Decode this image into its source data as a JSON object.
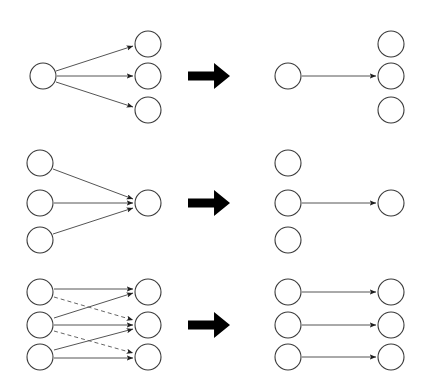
{
  "figure": {
    "background_color": "#ffffff",
    "node_fill": "#ffffff",
    "node_stroke": "#3a3a3a",
    "edge_color": "#555555",
    "transform_arrow_color": "#000000",
    "label_color": "#1a1a1a",
    "node_radius": 13
  },
  "panels": [
    {
      "id": "A",
      "label": "A",
      "label_x": 14,
      "label_y": 33,
      "description": "one source node fanning out to three target nodes",
      "left_nodes": [
        {
          "name": "a-source-1",
          "cx": 43,
          "cy": 76
        }
      ],
      "right_nodes": [
        {
          "name": "a-target-1",
          "cx": 148,
          "cy": 44
        },
        {
          "name": "a-target-2",
          "cx": 148,
          "cy": 76
        },
        {
          "name": "a-target-3",
          "cx": 148,
          "cy": 110
        }
      ],
      "edges": [
        {
          "from": [
            56,
            71
          ],
          "to": [
            133,
            46
          ],
          "style": "solid"
        },
        {
          "from": [
            57,
            76
          ],
          "to": [
            133,
            76
          ],
          "style": "solid"
        },
        {
          "from": [
            56,
            82
          ],
          "to": [
            133,
            107
          ],
          "style": "solid"
        }
      ]
    },
    {
      "id": "A-prime",
      "label": "A′",
      "label_x": 253,
      "label_y": 33,
      "description": "one source node with a single arrow to the middle target node",
      "left_nodes": [
        {
          "name": "aprime-source-1",
          "cx": 288,
          "cy": 76
        }
      ],
      "right_nodes": [
        {
          "name": "aprime-target-1",
          "cx": 391,
          "cy": 44
        },
        {
          "name": "aprime-target-2",
          "cx": 391,
          "cy": 76
        },
        {
          "name": "aprime-target-3",
          "cx": 391,
          "cy": 110
        }
      ],
      "edges": [
        {
          "from": [
            302,
            76
          ],
          "to": [
            376,
            76
          ],
          "style": "solid"
        }
      ]
    },
    {
      "id": "B",
      "label": "B",
      "label_x": 14,
      "label_y": 161,
      "description": "three source nodes converging onto one target node",
      "left_nodes": [
        {
          "name": "b-source-1",
          "cx": 40,
          "cy": 163
        },
        {
          "name": "b-source-2",
          "cx": 40,
          "cy": 203
        },
        {
          "name": "b-source-3",
          "cx": 40,
          "cy": 240
        }
      ],
      "right_nodes": [
        {
          "name": "b-target-1",
          "cx": 148,
          "cy": 203
        }
      ],
      "edges": [
        {
          "from": [
            53,
            169
          ],
          "to": [
            133,
            199
          ],
          "style": "solid"
        },
        {
          "from": [
            54,
            203
          ],
          "to": [
            133,
            203
          ],
          "style": "solid"
        },
        {
          "from": [
            53,
            234
          ],
          "to": [
            133,
            208
          ],
          "style": "solid"
        }
      ]
    },
    {
      "id": "B-prime",
      "label": "B′",
      "label_x": 253,
      "label_y": 161,
      "description": "three source nodes with a single arrow from the middle one",
      "left_nodes": [
        {
          "name": "bprime-source-1",
          "cx": 288,
          "cy": 163
        },
        {
          "name": "bprime-source-2",
          "cx": 288,
          "cy": 203
        },
        {
          "name": "bprime-source-3",
          "cx": 288,
          "cy": 240
        }
      ],
      "right_nodes": [
        {
          "name": "bprime-target-1",
          "cx": 391,
          "cy": 203
        }
      ],
      "edges": [
        {
          "from": [
            302,
            203
          ],
          "to": [
            376,
            203
          ],
          "style": "solid"
        }
      ]
    },
    {
      "id": "C",
      "label": "C",
      "label_x": 14,
      "label_y": 283,
      "description": "three source nodes mapping to three target nodes with crossing solid and dashed edges",
      "left_nodes": [
        {
          "name": "c-source-1",
          "cx": 40,
          "cy": 292
        },
        {
          "name": "c-source-2",
          "cx": 40,
          "cy": 325
        },
        {
          "name": "c-source-3",
          "cx": 40,
          "cy": 357
        }
      ],
      "right_nodes": [
        {
          "name": "c-target-1",
          "cx": 148,
          "cy": 292
        },
        {
          "name": "c-target-2",
          "cx": 148,
          "cy": 325
        },
        {
          "name": "c-target-3",
          "cx": 148,
          "cy": 357
        }
      ],
      "edges": [
        {
          "from": [
            54,
            289
          ],
          "to": [
            133,
            289
          ],
          "style": "solid"
        },
        {
          "from": [
            54,
            297
          ],
          "to": [
            133,
            320
          ],
          "style": "dashed"
        },
        {
          "from": [
            54,
            318
          ],
          "to": [
            133,
            293
          ],
          "style": "solid"
        },
        {
          "from": [
            54,
            325
          ],
          "to": [
            133,
            325
          ],
          "style": "solid"
        },
        {
          "from": [
            54,
            331
          ],
          "to": [
            133,
            353
          ],
          "style": "dashed"
        },
        {
          "from": [
            54,
            350
          ],
          "to": [
            133,
            329
          ],
          "style": "solid"
        },
        {
          "from": [
            54,
            358
          ],
          "to": [
            133,
            358
          ],
          "style": "solid"
        }
      ]
    },
    {
      "id": "C-prime",
      "label": "C′",
      "label_x": 253,
      "label_y": 283,
      "description": "three source nodes each with one horizontal arrow to the matching target node",
      "left_nodes": [
        {
          "name": "cprime-source-1",
          "cx": 288,
          "cy": 292
        },
        {
          "name": "cprime-source-2",
          "cx": 288,
          "cy": 325
        },
        {
          "name": "cprime-source-3",
          "cx": 288,
          "cy": 357
        }
      ],
      "right_nodes": [
        {
          "name": "cprime-target-1",
          "cx": 391,
          "cy": 292
        },
        {
          "name": "cprime-target-2",
          "cx": 391,
          "cy": 325
        },
        {
          "name": "cprime-target-3",
          "cx": 391,
          "cy": 357
        }
      ],
      "edges": [
        {
          "from": [
            302,
            292
          ],
          "to": [
            376,
            292
          ],
          "style": "solid"
        },
        {
          "from": [
            302,
            325
          ],
          "to": [
            376,
            325
          ],
          "style": "solid"
        },
        {
          "from": [
            302,
            357
          ],
          "to": [
            376,
            357
          ],
          "style": "solid"
        }
      ]
    }
  ],
  "transform_arrows": [
    {
      "name": "transform-arrow-a",
      "x": 188,
      "y": 76,
      "length": 42,
      "thickness": 9
    },
    {
      "name": "transform-arrow-b",
      "x": 188,
      "y": 203,
      "length": 42,
      "thickness": 9
    },
    {
      "name": "transform-arrow-c",
      "x": 188,
      "y": 325,
      "length": 42,
      "thickness": 9
    }
  ]
}
